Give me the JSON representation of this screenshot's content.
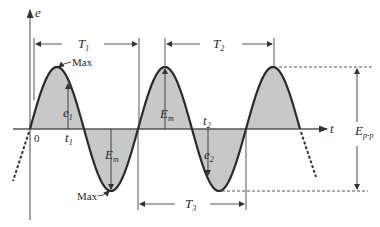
{
  "diagram": {
    "type": "sinusoidal-waveform",
    "axes": {
      "vertical_label": "e",
      "horizontal_label": "t",
      "origin_label": "0"
    },
    "periods": [
      {
        "name": "T1",
        "base": "T",
        "sub": "1"
      },
      {
        "name": "T2",
        "base": "T",
        "sub": "2"
      },
      {
        "name": "T3",
        "base": "T",
        "sub": "3"
      }
    ],
    "labels": {
      "max_top": "Max",
      "max_bottom": "Max",
      "e1_base": "e",
      "e1_sub": "1",
      "e2_base": "e",
      "e2_sub": "2",
      "t1_base": "t",
      "t1_sub": "1",
      "t2_base": "t",
      "t2_sub": "2",
      "em_pos_base": "E",
      "em_pos_sub": "m",
      "em_neg_base": "E",
      "em_neg_sub": "m",
      "epp_base": "E",
      "epp_sub": "p-p"
    },
    "colors": {
      "fill": "#c8c8c8",
      "curve": "#2a2a2a",
      "axis": "#555555"
    }
  }
}
